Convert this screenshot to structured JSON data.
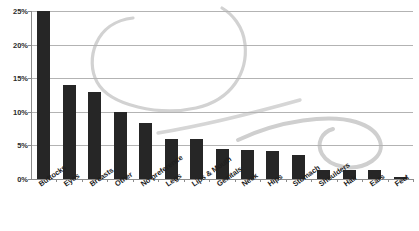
{
  "chart_data": {
    "type": "bar",
    "title": "",
    "xlabel": "",
    "ylabel": "",
    "ylim": [
      0,
      25
    ],
    "grid": true,
    "legend": "none",
    "y_ticks": [
      "0%",
      "5%",
      "10%",
      "15%",
      "20%",
      "25%"
    ],
    "y_tick_values": [
      0,
      5,
      10,
      15,
      20,
      25
    ],
    "categories": [
      "Buttocks",
      "Eyes",
      "Breasts",
      "Other",
      "No preference",
      "Legs",
      "Lips & Mouth",
      "Genitals",
      "Neck",
      "Hips",
      "Stomach",
      "Shoulders",
      "Hair",
      "Ears",
      "Feet"
    ],
    "values": [
      25,
      14,
      13,
      10,
      8.3,
      6,
      6,
      4.5,
      4.3,
      4.2,
      3.5,
      1.3,
      1.3,
      1.3,
      0.3
    ],
    "value_labels": [
      "25%",
      "14%",
      "13%",
      "10%",
      "8.3%",
      "6%",
      "6%",
      "4.5%",
      "4.3%",
      "4.2%",
      "3.5%",
      "1.3%",
      "1.3%",
      "1.3%",
      "0.3%"
    ],
    "bar_color": "#262626",
    "grid_color": "#b3b3b3",
    "axis_color": "#8c8c8c",
    "background_color": "#ffffff",
    "decoration_color": "#d4d4d4"
  }
}
